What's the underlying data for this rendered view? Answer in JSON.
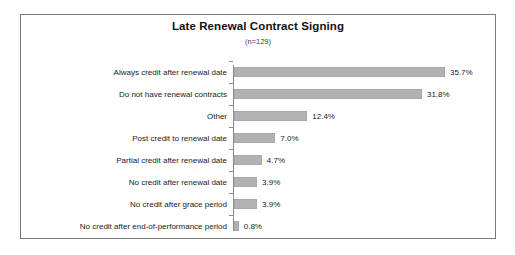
{
  "chart_data": {
    "type": "bar",
    "orientation": "horizontal",
    "title": "Late Renewal Contract Signing",
    "subtitle": "(n=129)",
    "xlabel": "",
    "ylabel": "",
    "xlim": [
      0,
      40
    ],
    "grid": false,
    "legend": null,
    "bar_color": "#b2b2b2",
    "frame_color": "#7a7a7a",
    "axis_color": "#8c8c8c",
    "text_color": "#1a1a1a",
    "categories": [
      "Always credit after renewal date",
      "Do not have renewal contracts",
      "Other",
      "Post credit to renewal date",
      "Partial credit after renewal date",
      "No credit after renewal date",
      "No credit after grace period",
      "No credit after end-of-performance period"
    ],
    "values": [
      35.7,
      31.8,
      12.4,
      7.0,
      4.7,
      3.9,
      3.9,
      0.8
    ],
    "value_labels": [
      "35.7%",
      "31.8%",
      "12.4%",
      "7.0%",
      "4.7%",
      "3.9%",
      "3.9%",
      "0.8%"
    ]
  }
}
